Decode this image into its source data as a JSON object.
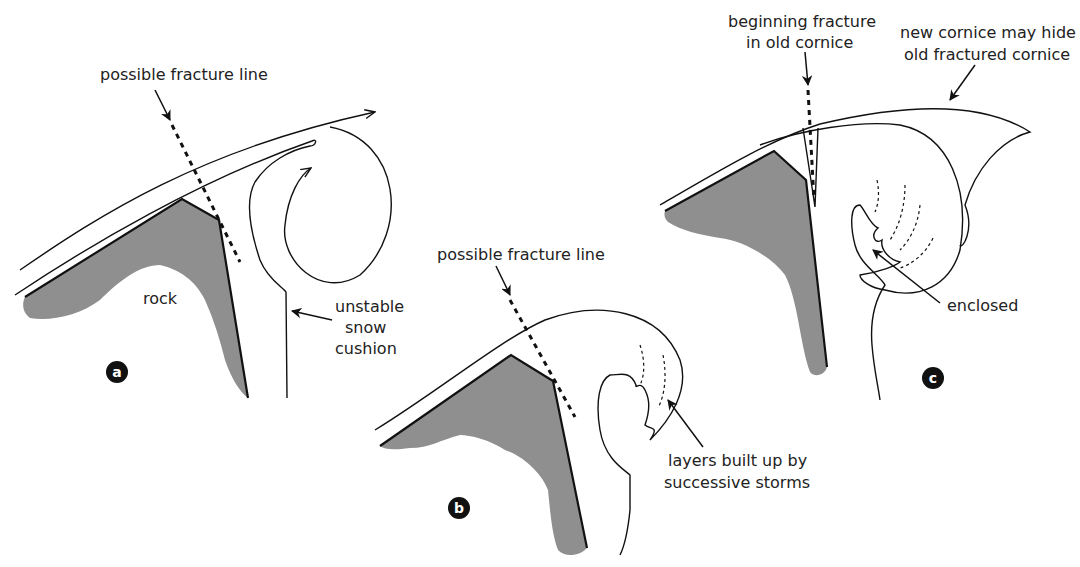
{
  "panels": {
    "a": {
      "badge": "a",
      "fracture_label": "possible fracture line",
      "rock_label": "rock",
      "cushion_label": [
        "unstable",
        "snow",
        "cushion"
      ]
    },
    "b": {
      "badge": "b",
      "fracture_label": "possible fracture line",
      "layers_label": [
        "layers built up by",
        "successive storms"
      ]
    },
    "c": {
      "badge": "c",
      "fracture_label": [
        "beginning fracture",
        "in old cornice"
      ],
      "new_cornice_label": [
        "new cornice may hide",
        "old fractured cornice"
      ],
      "enclosed_label": "enclosed"
    }
  },
  "colors": {
    "rock": "#8f8f8f",
    "line": "#111111",
    "background": "#ffffff"
  }
}
